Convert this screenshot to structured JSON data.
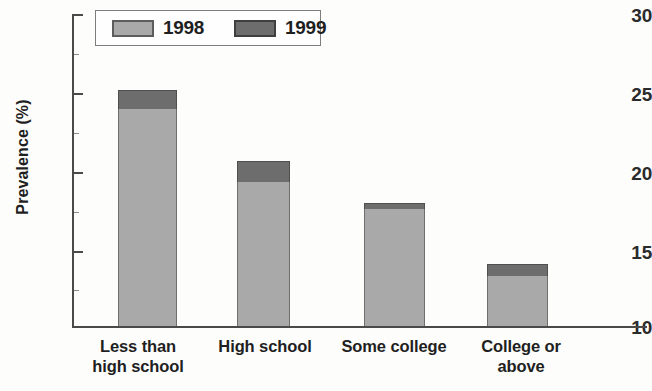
{
  "chart_data": {
    "type": "bar",
    "subtype": "stacked",
    "title": "",
    "xlabel": "",
    "ylabel": "Prevalence (%)",
    "ylim": [
      10,
      30
    ],
    "yticks": [
      10,
      15,
      20,
      25,
      30
    ],
    "ytick_labels": [
      "10",
      "15",
      "20",
      "25",
      "30"
    ],
    "grid": false,
    "legend_position": "top-left",
    "categories": [
      "Less than high school",
      "High school",
      "Some college",
      "College or above"
    ],
    "category_lines": [
      [
        "Less than",
        "high school"
      ],
      [
        "High school"
      ],
      [
        "Some college"
      ],
      [
        "College or",
        "above"
      ]
    ],
    "series": [
      {
        "name": "1998",
        "color": "#a9a9a9",
        "values": [
          23.9,
          19.2,
          17.5,
          13.2
        ]
      },
      {
        "name": "1999",
        "color": "#6d6d6d",
        "values": [
          25.1,
          20.6,
          17.9,
          14.0
        ]
      }
    ]
  },
  "legend": {
    "entries": [
      {
        "label": "1998",
        "color": "#a9a9a9"
      },
      {
        "label": "1999",
        "color": "#6d6d6d"
      }
    ]
  },
  "axis": {
    "y_title": "Prevalence (%)",
    "ticks": [
      {
        "label": "30",
        "value": 30
      },
      {
        "label": "25",
        "value": 25
      },
      {
        "label": "20",
        "value": 20
      },
      {
        "label": "15",
        "value": 15
      },
      {
        "label": "10",
        "value": 10
      }
    ]
  }
}
